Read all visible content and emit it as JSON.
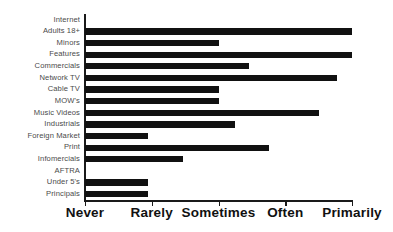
{
  "chart_data": {
    "type": "bar",
    "orientation": "horizontal",
    "title": "",
    "subtitle": "",
    "xlabel": "",
    "ylabel": "",
    "grid": false,
    "legend": null,
    "xlim": [
      0,
      4
    ],
    "x_tick_labels": [
      "Never",
      "Rarely",
      "Sometimes",
      "Often",
      "Primarily"
    ],
    "x_tick_values": [
      0,
      1,
      2,
      3,
      4
    ],
    "categories": [
      "Internet",
      "Adults 18+",
      "Minors",
      "Features",
      "Commercials",
      "Network TV",
      "Cable TV",
      "MOW's",
      "Music Videos",
      "Industrials",
      "Foreign Market",
      "Print",
      "Infomercials",
      "AFTRA",
      "Under 5's",
      "Principals"
    ],
    "values": [
      0,
      4.0,
      2.0,
      4.0,
      2.45,
      3.78,
      2.0,
      2.0,
      3.5,
      2.25,
      0.95,
      2.75,
      1.47,
      0,
      0.95,
      0.95
    ],
    "bar_color": "#111111",
    "axis_color": "#1a1a1a",
    "label_color": "#4a4a4a",
    "background_color": "#ffffff"
  }
}
